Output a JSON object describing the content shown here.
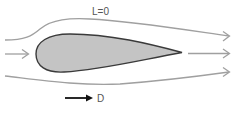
{
  "diagram": {
    "lift_label": "L=0",
    "drag_label": "D",
    "colors": {
      "background": "#ffffff",
      "streamline": "#a0a0a0",
      "body_fill": "#c4c4c4",
      "body_stroke": "#3a3a3a",
      "drag_arrow": "#111111",
      "text": "#555555"
    },
    "elements": [
      {
        "id": "streamline-top",
        "type": "streamline",
        "direction": "right"
      },
      {
        "id": "streamline-middle",
        "type": "streamline",
        "direction": "right",
        "split_by_body": true
      },
      {
        "id": "streamline-bottom",
        "type": "streamline",
        "direction": "right"
      },
      {
        "id": "teardrop-body",
        "type": "airfoil-shape",
        "fill": "gray"
      },
      {
        "id": "drag-arrow",
        "type": "force-arrow",
        "direction": "right",
        "label": "D"
      }
    ]
  }
}
